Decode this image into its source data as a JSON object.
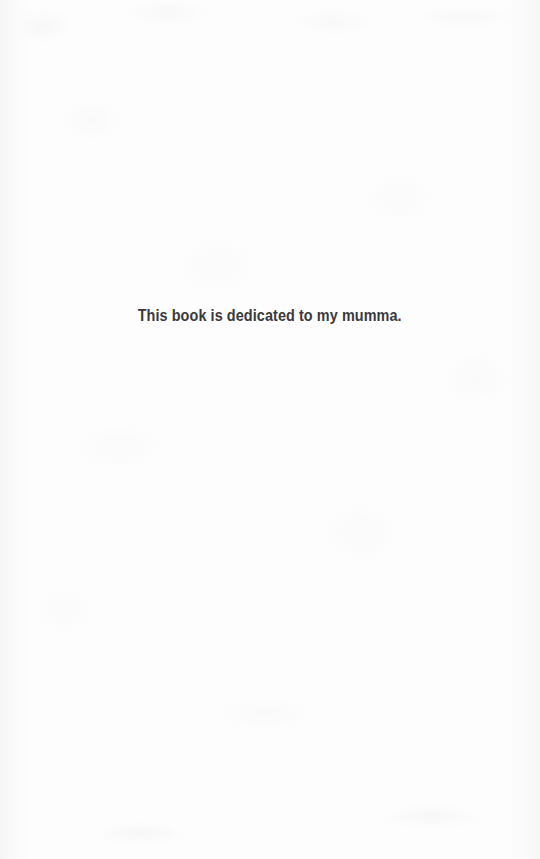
{
  "page": {
    "name": "dedication-page",
    "width": 540,
    "height": 859,
    "background_color": "#fdfdfd",
    "paper_tint_color": "#92969e"
  },
  "dedication": {
    "text": "This book is dedicated to my mumma.",
    "text_color": "#3a3a3c",
    "alignment": "center"
  }
}
